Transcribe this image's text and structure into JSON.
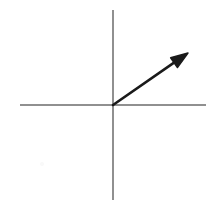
{
  "figure": {
    "kind": "vector-diagram",
    "title": "Vector in the first quadrant on Cartesian axes",
    "canvas": {
      "width": 216,
      "height": 213,
      "background_color": "#ffffff"
    }
  },
  "chart_data": {
    "type": "scatter",
    "title": "",
    "subtitle": "",
    "xlabel": "",
    "ylabel": "",
    "grid": false,
    "legend": null,
    "axes": {
      "style": "cartesian-cross",
      "origin_px": [
        113,
        105
      ],
      "color": "#6b6b6b",
      "stroke_width": 1.5,
      "x_axis": {
        "label": "",
        "tick_labels": [],
        "start_px": [
          20,
          105
        ],
        "end_px": [
          206,
          105
        ],
        "arrowhead": false
      },
      "y_axis": {
        "label": "",
        "tick_labels": [],
        "start_px": [
          113,
          10
        ],
        "end_px": [
          113,
          200
        ],
        "arrowhead": false
      }
    },
    "annotations": [
      {
        "name": "vector-arrow",
        "kind": "arrow",
        "label": "",
        "color": "#1a1a1a",
        "stroke_width": 2.6,
        "tail_px": [
          113,
          105
        ],
        "head_px": [
          188,
          53
        ],
        "components_px": [
          75,
          -52
        ],
        "length_px": 91.3,
        "angle_degrees": 34.7,
        "quadrant": 1,
        "arrowhead": {
          "shape": "filled-triangle",
          "length_px": 17,
          "half_width_px": 6
        }
      }
    ],
    "marks": [
      {
        "name": "background-speck",
        "center_px": [
          42,
          164
        ],
        "radius_px": 2,
        "color": "#c8c8c8"
      }
    ]
  }
}
